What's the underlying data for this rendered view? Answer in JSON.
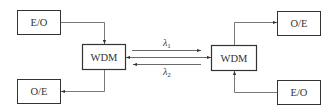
{
  "diagram": {
    "colors": {
      "stroke": "#333333",
      "text": "#333333",
      "background": "#ffffff"
    },
    "boxes": {
      "eo_left": {
        "label": "E/O"
      },
      "oe_left": {
        "label": "O/E"
      },
      "wdm_left": {
        "label": "WDM"
      },
      "wdm_right": {
        "label": "WDM"
      },
      "oe_right": {
        "label": "O/E"
      },
      "eo_right": {
        "label": "E/O"
      }
    },
    "wavelengths": {
      "lambda1": {
        "symbol": "λ",
        "subscript": "1",
        "direction": "left-to-right"
      },
      "lambda2": {
        "symbol": "λ",
        "subscript": "2",
        "direction": "right-to-left"
      }
    }
  }
}
